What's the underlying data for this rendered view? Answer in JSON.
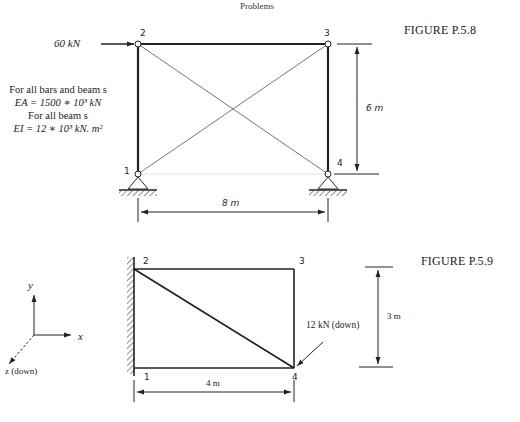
{
  "header": {
    "title": "Problems"
  },
  "figure_p58": {
    "caption": "FIGURE P.5.8",
    "load_label": "60 kN",
    "nodes": [
      "1",
      "2",
      "3",
      "4"
    ],
    "properties": [
      "For all bars and beam s",
      "EA = 1500 ∗ 10³ kN",
      "For all beam s",
      "EI = 12 ∗ 10³ kN. m²"
    ],
    "dim_height": "6 m",
    "dim_width": "8 m"
  },
  "figure_p59": {
    "caption": "FIGURE P.5.9",
    "axes": {
      "y": "y",
      "x": "x",
      "z": "z (down)"
    },
    "nodes": [
      "1",
      "2",
      "3",
      "4"
    ],
    "load_label": "12 kN (down)",
    "dim_height": "3 m",
    "dim_width": "4 m"
  },
  "colors": {
    "ink": "#222222",
    "thin": "#777777"
  }
}
